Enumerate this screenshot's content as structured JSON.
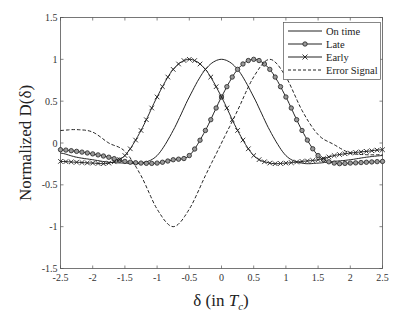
{
  "chart_data": {
    "type": "line",
    "title": "",
    "xlabel": "δ (in T_c)",
    "xlabel_main": "δ (in ",
    "xlabel_sym": "T",
    "xlabel_sub": "c",
    "xlabel_close": ")",
    "ylabel": "Normalized D(δ)",
    "xlim": [
      -2.5,
      2.5
    ],
    "ylim": [
      -1.5,
      1.5
    ],
    "xticks": [
      "-2.5",
      "-2",
      "-1.5",
      "-1",
      "-0.5",
      "0",
      "0.5",
      "1",
      "1.5",
      "2",
      "2.5"
    ],
    "yticks": [
      "1.5",
      "1",
      "0.5",
      "0",
      "-0.5",
      "-1",
      "-1.5"
    ],
    "grid": false,
    "legend_position": "upper right",
    "x": [
      -2.5,
      -2.25,
      -2.0,
      -1.75,
      -1.5,
      -1.25,
      -1.0,
      -0.75,
      -0.5,
      -0.25,
      0.0,
      0.25,
      0.5,
      0.75,
      1.0,
      1.25,
      1.5,
      1.75,
      2.0,
      2.25,
      2.5
    ],
    "series": [
      {
        "name": "On time",
        "style": "solid",
        "marker": "none",
        "values": [
          -0.12,
          -0.17,
          -0.2,
          -0.23,
          -0.24,
          -0.24,
          -0.15,
          0.15,
          0.55,
          0.88,
          1.0,
          0.88,
          0.55,
          0.15,
          -0.15,
          -0.24,
          -0.24,
          -0.22,
          -0.2,
          -0.17,
          -0.15
        ]
      },
      {
        "name": "Late",
        "style": "solid",
        "marker": "circle",
        "values": [
          -0.08,
          -0.1,
          -0.13,
          -0.17,
          -0.22,
          -0.24,
          -0.24,
          -0.2,
          -0.15,
          0.15,
          0.55,
          0.88,
          1.0,
          0.88,
          0.55,
          0.15,
          -0.15,
          -0.24,
          -0.24,
          -0.23,
          -0.22
        ]
      },
      {
        "name": "Early",
        "style": "solid",
        "marker": "x",
        "values": [
          -0.22,
          -0.23,
          -0.24,
          -0.24,
          -0.15,
          0.15,
          0.55,
          0.88,
          1.0,
          0.88,
          0.55,
          0.15,
          -0.15,
          -0.24,
          -0.24,
          -0.22,
          -0.2,
          -0.15,
          -0.12,
          -0.1,
          -0.08
        ]
      },
      {
        "name": "Error Signal",
        "style": "dashed",
        "marker": "none",
        "values": [
          0.15,
          0.16,
          0.13,
          0.0,
          -0.1,
          -0.39,
          -0.79,
          -1.0,
          -0.79,
          -0.39,
          0.0,
          0.39,
          0.79,
          1.0,
          0.79,
          0.39,
          0.1,
          -0.02,
          -0.12,
          -0.14,
          -0.14
        ]
      }
    ]
  },
  "legend": {
    "items": [
      "On time",
      "Late",
      "Early",
      "Error Signal"
    ]
  }
}
